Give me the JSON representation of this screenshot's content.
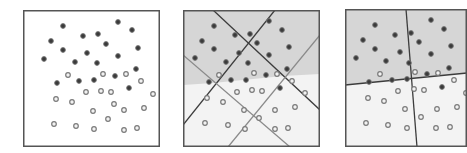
{
  "figure": {
    "colors": {
      "background": "#ffffff",
      "border": "#555555",
      "class_dark_fill": "#3a3a3a",
      "class_dark_stroke": "#777777",
      "class_light_fill": "#f2f2f2",
      "class_light_stroke": "#7a7a7a",
      "region_dark": "#d6d6d6",
      "region_light": "#f3f3f3",
      "line_dark": "#3c3c3c",
      "line_gray": "#8a8a8a"
    }
  },
  "panels": [
    {
      "id": "raw-points",
      "box": {
        "x": 23,
        "y": 10,
        "w": 137,
        "h": 137
      },
      "shading": null,
      "lines": [],
      "points_dark": [
        [
          40,
          16
        ],
        [
          95,
          12
        ],
        [
          109,
          20
        ],
        [
          28,
          31
        ],
        [
          60,
          26
        ],
        [
          75,
          24
        ],
        [
          83,
          34
        ],
        [
          115,
          38
        ],
        [
          40,
          40
        ],
        [
          21,
          49
        ],
        [
          64,
          43
        ],
        [
          95,
          46
        ],
        [
          52,
          52
        ],
        [
          74,
          53
        ],
        [
          113,
          59
        ],
        [
          34,
          73
        ],
        [
          56,
          71
        ],
        [
          71,
          70
        ],
        [
          92,
          66
        ],
        [
          106,
          78
        ]
      ],
      "points_light": [
        [
          45,
          65
        ],
        [
          80,
          64
        ],
        [
          103,
          64
        ],
        [
          118,
          71
        ],
        [
          63,
          82
        ],
        [
          78,
          81
        ],
        [
          88,
          82
        ],
        [
          130,
          84
        ],
        [
          33,
          89
        ],
        [
          49,
          92
        ],
        [
          91,
          94
        ],
        [
          121,
          98
        ],
        [
          70,
          101
        ],
        [
          101,
          100
        ],
        [
          85,
          109
        ],
        [
          31,
          114
        ],
        [
          53,
          116
        ],
        [
          71,
          119
        ],
        [
          101,
          120
        ],
        [
          114,
          118
        ]
      ]
    },
    {
      "id": "four-separators",
      "box": {
        "x": 183,
        "y": 10,
        "w": 137,
        "h": 137
      },
      "shading": {
        "boundary": [
          [
            0,
            75
          ],
          [
            30,
            73
          ],
          [
            70,
            69
          ],
          [
            100,
            66
          ],
          [
            137,
            64
          ]
        ]
      },
      "lines": [
        {
          "style": "dark",
          "x1": 30,
          "y1": 0,
          "x2": 137,
          "y2": 100
        },
        {
          "style": "dark",
          "x1": 92,
          "y1": 0,
          "x2": 0,
          "y2": 115
        },
        {
          "style": "gray",
          "x1": 0,
          "y1": 45,
          "x2": 107,
          "y2": 137
        },
        {
          "style": "gray",
          "x1": 137,
          "y1": 25,
          "x2": 45,
          "y2": 137
        }
      ],
      "points_dark": [
        [
          31,
          16
        ],
        [
          86,
          11
        ],
        [
          99,
          20
        ],
        [
          19,
          31
        ],
        [
          52,
          25
        ],
        [
          67,
          24
        ],
        [
          74,
          33
        ],
        [
          106,
          37
        ],
        [
          31,
          39
        ],
        [
          12,
          48
        ],
        [
          56,
          43
        ],
        [
          86,
          45
        ],
        [
          43,
          52
        ],
        [
          65,
          53
        ],
        [
          104,
          59
        ],
        [
          26,
          72
        ],
        [
          48,
          70
        ],
        [
          63,
          70
        ],
        [
          83,
          65
        ],
        [
          97,
          78
        ]
      ],
      "points_light": [
        [
          36,
          65
        ],
        [
          71,
          63
        ],
        [
          94,
          64
        ],
        [
          109,
          71
        ],
        [
          54,
          82
        ],
        [
          69,
          80
        ],
        [
          79,
          81
        ],
        [
          122,
          83
        ],
        [
          24,
          88
        ],
        [
          40,
          92
        ],
        [
          61,
          100
        ],
        [
          92,
          100
        ],
        [
          112,
          97
        ],
        [
          76,
          108
        ],
        [
          22,
          113
        ],
        [
          45,
          115
        ],
        [
          62,
          119
        ],
        [
          92,
          119
        ],
        [
          105,
          118
        ]
      ]
    },
    {
      "id": "two-line-partition",
      "box": {
        "x": 345,
        "y": 9,
        "w": 122,
        "h": 138
      },
      "shading": {
        "boundary": [
          [
            0,
            76
          ],
          [
            122,
            64
          ]
        ]
      },
      "lines": [
        {
          "style": "dark",
          "x1": 0,
          "y1": 76,
          "x2": 122,
          "y2": 64
        },
        {
          "style": "dark",
          "x1": 61,
          "y1": 0,
          "x2": 72,
          "y2": 138
        }
      ],
      "points_dark": [
        [
          30,
          16
        ],
        [
          86,
          11
        ],
        [
          99,
          20
        ],
        [
          18,
          31
        ],
        [
          50,
          26
        ],
        [
          66,
          24
        ],
        [
          74,
          33
        ],
        [
          106,
          37
        ],
        [
          30,
          40
        ],
        [
          11,
          49
        ],
        [
          55,
          43
        ],
        [
          86,
          45
        ],
        [
          41,
          52
        ],
        [
          64,
          54
        ],
        [
          104,
          59
        ],
        [
          24,
          73
        ],
        [
          47,
          71
        ],
        [
          62,
          70
        ],
        [
          82,
          65
        ],
        [
          97,
          78
        ]
      ],
      "points_light": [
        [
          35,
          65
        ],
        [
          70,
          63
        ],
        [
          93,
          64
        ],
        [
          109,
          71
        ],
        [
          53,
          82
        ],
        [
          69,
          80
        ],
        [
          79,
          81
        ],
        [
          121,
          84
        ],
        [
          23,
          89
        ],
        [
          39,
          92
        ],
        [
          60,
          100
        ],
        [
          92,
          100
        ],
        [
          112,
          98
        ],
        [
          76,
          108
        ],
        [
          21,
          114
        ],
        [
          43,
          116
        ],
        [
          62,
          119
        ],
        [
          91,
          119
        ],
        [
          105,
          118
        ]
      ]
    }
  ]
}
